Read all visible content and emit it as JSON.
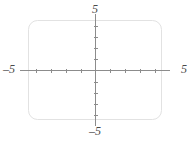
{
  "chart_data": {
    "type": "scatter",
    "title": "",
    "subtitle": "",
    "xlabel": "",
    "ylabel": "",
    "xlim": [
      -5,
      5
    ],
    "ylim": [
      -5,
      5
    ],
    "grid": false,
    "legend": null,
    "series": [],
    "annotations": [],
    "axis_end_labels": {
      "top": "5",
      "bottom": "–5",
      "left": "–5",
      "right": "5"
    },
    "x_ticks": [
      -4,
      -3,
      -2,
      -1,
      1,
      2,
      3,
      4
    ],
    "y_ticks": [
      -4,
      -3,
      -2,
      -1,
      1,
      2,
      3,
      4
    ],
    "x_tick_labels": [],
    "y_tick_labels": [],
    "tick_interval": 1
  },
  "figure": {
    "frame": {
      "x": 28,
      "y": 20,
      "width": 134,
      "height": 100,
      "corner_radius": 9
    },
    "origin": {
      "x": 95,
      "y": 70
    },
    "axes": {
      "x_start": 20,
      "x_end": 170,
      "y_start": 14,
      "y_end": 126,
      "unit_px_x": 14.8,
      "unit_px_y": 11.1,
      "tick_half_length": 2
    }
  },
  "colors": {
    "background": "#ffffff",
    "frame_stroke": "#e2e2e2",
    "axis_stroke": "#8c8c8c",
    "label_text": "#4a4a4a"
  }
}
